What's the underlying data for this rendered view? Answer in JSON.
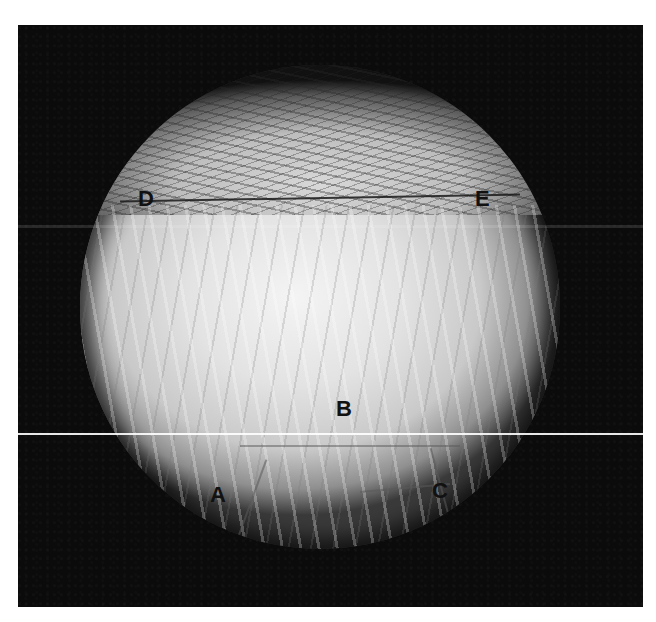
{
  "image": {
    "description": "Grayscale micrograph: circular field of view on black background showing a fractured/striated specimen with labeled regions",
    "colors": {
      "background": "#ffffff",
      "frame": "#0b0b0b",
      "field_center": "#f4f4f4",
      "label_text": "#111111"
    }
  },
  "labels": {
    "a": "A",
    "b": "B",
    "c": "C",
    "d": "D",
    "e": "E"
  }
}
